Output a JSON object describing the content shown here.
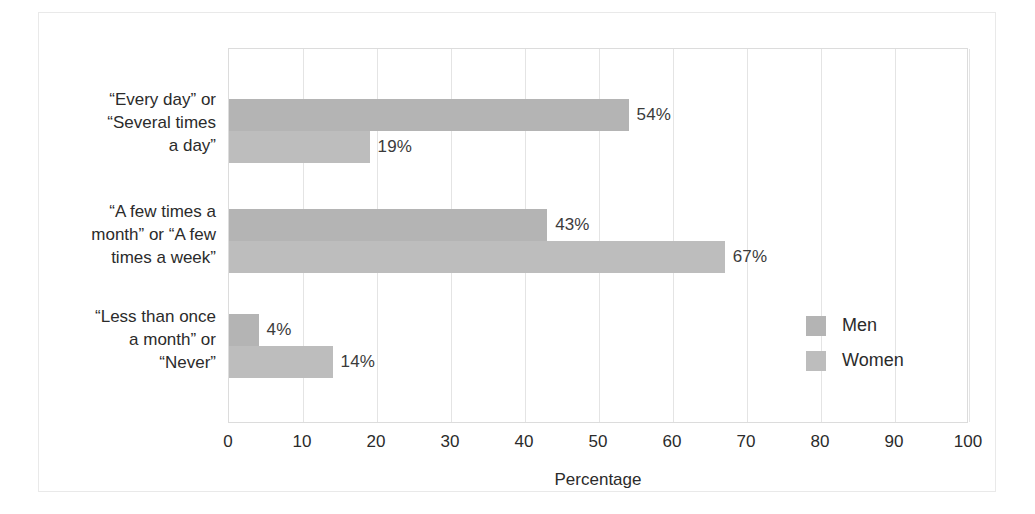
{
  "chart_data": {
    "type": "bar",
    "orientation": "horizontal",
    "title": "",
    "xlabel": "Percentage",
    "ylabel": "",
    "xlim": [
      0,
      100
    ],
    "xticks": [
      0,
      10,
      20,
      30,
      40,
      50,
      60,
      70,
      80,
      90,
      100
    ],
    "xtick_labels": [
      "0",
      "10",
      "20",
      "30",
      "40",
      "50",
      "60",
      "70",
      "80",
      "90",
      "100"
    ],
    "grid": true,
    "grid_axis": "x",
    "legend_position": "center-right",
    "categories": [
      "“Every day” or “Several times a day”",
      "“A few times a month” or “A few times a week”",
      "“Less than once a month” or “Never”"
    ],
    "category_label_lines": [
      [
        "“Every day” or",
        "“Several times",
        "a day”"
      ],
      [
        "“A few times a",
        "month” or “A few",
        "times a week”"
      ],
      [
        "“Less than once",
        "a month” or",
        "“Never”"
      ]
    ],
    "series": [
      {
        "name": "Men",
        "color": "#b4b4b4",
        "values": [
          54,
          43,
          4
        ],
        "data_labels": [
          "54%",
          "43%",
          "4%"
        ]
      },
      {
        "name": "Women",
        "color": "#bdbdbd",
        "values": [
          19,
          67,
          14
        ],
        "data_labels": [
          "19%",
          "67%",
          "14%"
        ]
      }
    ]
  },
  "legend": {
    "entries": [
      {
        "label": "Men",
        "color": "#b4b4b4"
      },
      {
        "label": "Women",
        "color": "#bdbdbd"
      }
    ]
  },
  "axis": {
    "x_title": "Percentage"
  }
}
